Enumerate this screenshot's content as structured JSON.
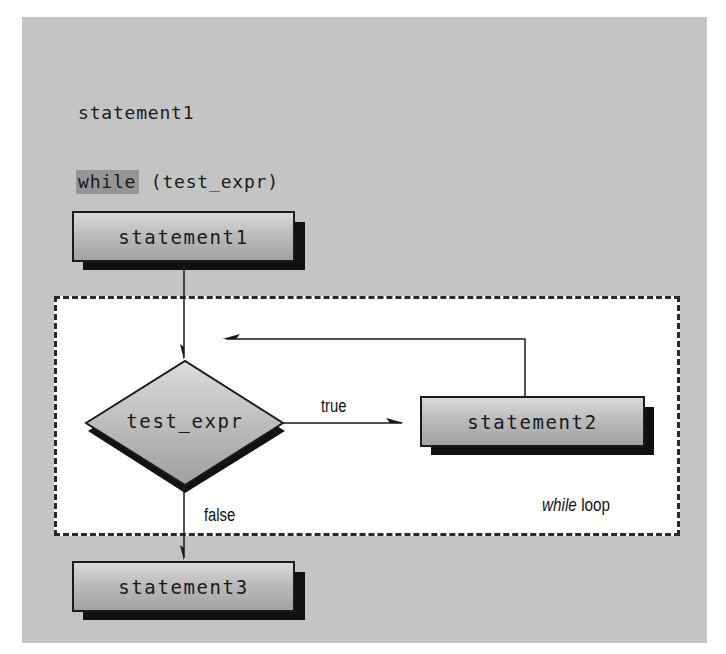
{
  "code": {
    "lines": [
      {
        "text": "statement1"
      },
      {
        "keyword": "while",
        "rest": " (test_expr)"
      },
      {
        "text": "statement2"
      },
      {
        "text": "statement3"
      }
    ]
  },
  "flowchart": {
    "nodes": {
      "statement1": {
        "label": "statement1",
        "shape": "rectangle"
      },
      "test_expr": {
        "label": "test_expr",
        "shape": "diamond"
      },
      "statement2": {
        "label": "statement2",
        "shape": "rectangle"
      },
      "statement3": {
        "label": "statement3",
        "shape": "rectangle"
      }
    },
    "edges": [
      {
        "from": "statement1",
        "to": "test_expr",
        "label": ""
      },
      {
        "from": "test_expr",
        "to": "statement2",
        "label": "true"
      },
      {
        "from": "statement2",
        "to": "test_expr",
        "label": ""
      },
      {
        "from": "test_expr",
        "to": "statement3",
        "label": "false"
      }
    ],
    "edge_labels": {
      "true": "true",
      "false": "false"
    },
    "loop_region": {
      "caption_italic": "while",
      "caption_rest": " loop"
    }
  },
  "colors": {
    "panel_background": "#c4c4c4",
    "loop_region_background": "#ffffff",
    "keyword_highlight": "#959595",
    "outline": "#1b1b1b",
    "shadow": "#111111"
  }
}
